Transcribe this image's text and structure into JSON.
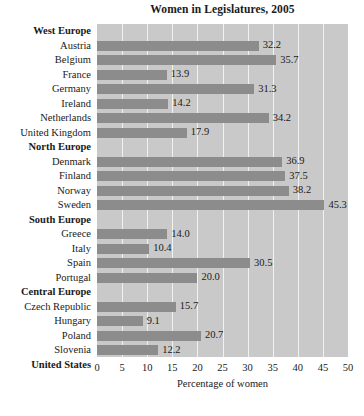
{
  "chart_data": {
    "type": "bar",
    "orientation": "horizontal",
    "title": "Women in Legislatures, 2005",
    "xlabel": "Percentage of women",
    "ylabel": "",
    "xlim": [
      0,
      50
    ],
    "xticks": [
      0,
      5,
      10,
      15,
      20,
      25,
      30,
      35,
      40,
      45,
      50
    ],
    "grid": true,
    "legend": false,
    "bar_color": "#8c8c8c",
    "plot_background": "#c9c9c9",
    "gridline_color": "#f2f2f2",
    "rows": [
      {
        "label": "West Europe",
        "type": "group",
        "value": null
      },
      {
        "label": "Austria",
        "type": "bar",
        "value": 32.2
      },
      {
        "label": "Belgium",
        "type": "bar",
        "value": 35.7
      },
      {
        "label": "France",
        "type": "bar",
        "value": 13.9
      },
      {
        "label": "Germany",
        "type": "bar",
        "value": 31.3
      },
      {
        "label": "Ireland",
        "type": "bar",
        "value": 14.2
      },
      {
        "label": "Netherlands",
        "type": "bar",
        "value": 34.2
      },
      {
        "label": "United Kingdom",
        "type": "bar",
        "value": 17.9
      },
      {
        "label": "North Europe",
        "type": "group",
        "value": null
      },
      {
        "label": "Denmark",
        "type": "bar",
        "value": 36.9
      },
      {
        "label": "Finland",
        "type": "bar",
        "value": 37.5
      },
      {
        "label": "Norway",
        "type": "bar",
        "value": 38.2
      },
      {
        "label": "Sweden",
        "type": "bar",
        "value": 45.3
      },
      {
        "label": "South Europe",
        "type": "group",
        "value": null
      },
      {
        "label": "Greece",
        "type": "bar",
        "value": 14.0
      },
      {
        "label": "Italy",
        "type": "bar",
        "value": 10.4
      },
      {
        "label": "Spain",
        "type": "bar",
        "value": 30.5
      },
      {
        "label": "Portugal",
        "type": "bar",
        "value": 20.0
      },
      {
        "label": "Central Europe",
        "type": "group",
        "value": null
      },
      {
        "label": "Czech Republic",
        "type": "bar",
        "value": 15.7
      },
      {
        "label": "Hungary",
        "type": "bar",
        "value": 9.1
      },
      {
        "label": "Poland",
        "type": "bar",
        "value": 20.7
      },
      {
        "label": "Slovenia",
        "type": "bar",
        "value": 12.2
      },
      {
        "label": "United States",
        "type": "total",
        "value": 14.8
      }
    ]
  }
}
